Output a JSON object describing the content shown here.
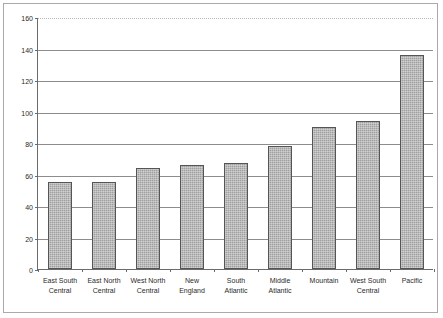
{
  "chart_data": {
    "type": "bar",
    "title": "",
    "subtitle": "",
    "xlabel": "",
    "ylabel": "",
    "ylim": [
      0,
      160
    ],
    "ytick_step": 20,
    "yticks": [
      0,
      20,
      40,
      60,
      80,
      100,
      120,
      140,
      160
    ],
    "grid": true,
    "legend": false,
    "legend_position": "none",
    "bar_color": "#a0a0a0",
    "bar_border_color": "#555555",
    "categories": [
      "East South Central",
      "East North Central",
      "West North Central",
      "New England",
      "South Atlantic",
      "Middle Atlantic",
      "Mountain",
      "West South Central",
      "Pacific"
    ],
    "category_lines": [
      [
        "East South",
        "Central"
      ],
      [
        "East North",
        "Central"
      ],
      [
        "West North",
        "Central"
      ],
      [
        "New",
        "England"
      ],
      [
        "South",
        "Atlantic"
      ],
      [
        "Middle",
        "Atlantic"
      ],
      [
        "Mountain",
        ""
      ],
      [
        "West South",
        "Central"
      ],
      [
        "Pacific",
        ""
      ]
    ],
    "values": [
      55,
      55,
      64,
      66,
      67,
      78,
      90,
      94,
      136
    ]
  }
}
